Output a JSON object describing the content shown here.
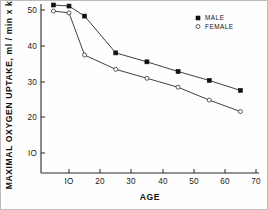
{
  "chart_data": {
    "type": "line",
    "title": "",
    "xlabel": "AGE",
    "ylabel": "MAXIMAL OXYGEN UPTAKE, ml / min x kg",
    "xlim": [
      0,
      70
    ],
    "ylim": [
      0,
      52
    ],
    "xticks": [
      10,
      20,
      30,
      40,
      50,
      60,
      70
    ],
    "xtick_labels": [
      "IO",
      "20",
      "30",
      "40",
      "50",
      "60",
      "70"
    ],
    "yticks": [
      10,
      20,
      30,
      40,
      50
    ],
    "ytick_labels": [
      "IO",
      "20",
      "30",
      "40",
      "50"
    ],
    "grid": false,
    "legend_position": "top-right",
    "x": [
      5,
      10,
      15,
      25,
      35,
      45,
      55,
      65
    ],
    "series": [
      {
        "name": "MALE",
        "marker": "filled-square",
        "values": [
          51.4,
          51.1,
          48.3,
          38.0,
          35.5,
          32.8,
          30.3,
          27.5
        ]
      },
      {
        "name": "FEMALE",
        "marker": "open-circle",
        "values": [
          49.7,
          49.2,
          37.4,
          33.4,
          30.9,
          28.4,
          24.8,
          21.6
        ]
      }
    ]
  },
  "legend": {
    "entries": [
      {
        "label": "MALE",
        "marker": "filled-square"
      },
      {
        "label": "FEMALE",
        "marker": "open-circle"
      }
    ]
  },
  "axes": {
    "x_title": "AGE",
    "y_title": "MAXIMAL OXYGEN UPTAKE, ml / min x kg"
  }
}
